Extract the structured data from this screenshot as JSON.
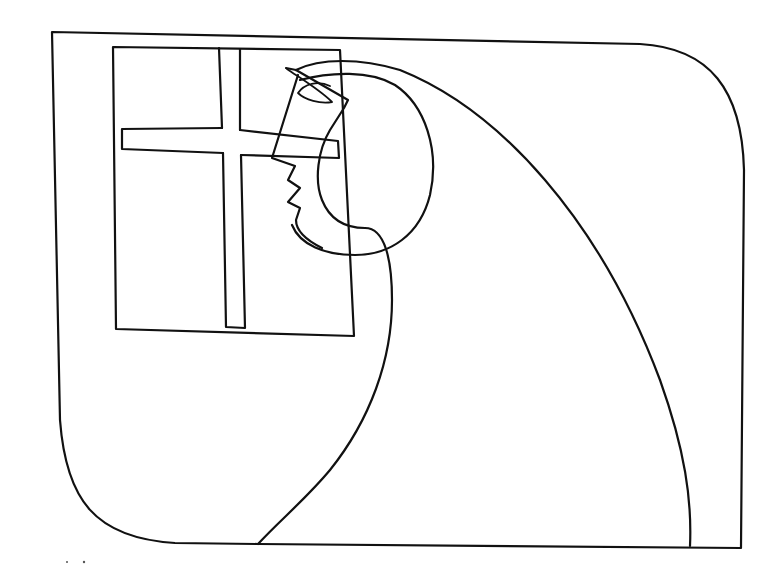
{
  "artwork": {
    "type": "line-drawing",
    "subject": "figure-at-cross-window",
    "colors": {
      "background": "#ffffff",
      "ink": "#111111"
    },
    "elements": [
      "frame",
      "window",
      "window-cross",
      "figure-head",
      "figure-profile",
      "figure-body"
    ]
  }
}
